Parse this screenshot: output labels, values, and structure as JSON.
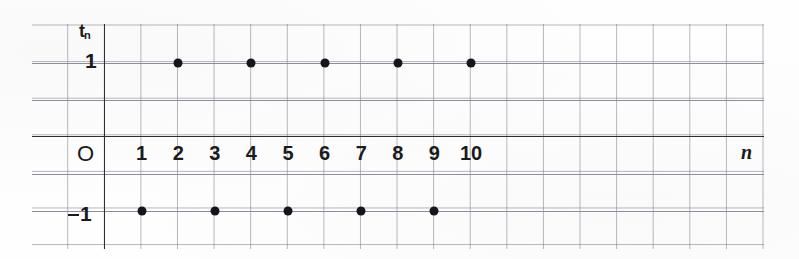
{
  "chart_data": {
    "type": "scatter",
    "title": "",
    "xlabel": "n",
    "ylabel": "t_n",
    "x": [
      1,
      2,
      3,
      4,
      5,
      6,
      7,
      8,
      9,
      10
    ],
    "values": [
      -1,
      1,
      -1,
      1,
      -1,
      1,
      -1,
      1,
      -1,
      1
    ],
    "series": [
      {
        "name": "t_n",
        "points": [
          {
            "n": 1,
            "t": -1
          },
          {
            "n": 2,
            "t": 1
          },
          {
            "n": 3,
            "t": -1
          },
          {
            "n": 4,
            "t": 1
          },
          {
            "n": 5,
            "t": -1
          },
          {
            "n": 6,
            "t": 1
          },
          {
            "n": 7,
            "t": -1
          },
          {
            "n": 8,
            "t": 1
          },
          {
            "n": 9,
            "t": -1
          },
          {
            "n": 10,
            "t": 1
          }
        ]
      }
    ],
    "xlim": [
      0,
      18
    ],
    "ylim": [
      -1.5,
      2
    ],
    "xticks": [
      "1",
      "2",
      "3",
      "4",
      "5",
      "6",
      "7",
      "8",
      "9",
      "10"
    ],
    "yticks": [
      "1",
      "-1"
    ],
    "grid": true,
    "legend": "none",
    "marker": "filled-circle",
    "marker_color": "#15151a"
  },
  "axes": {
    "y_axis_label": "t",
    "y_axis_label_sub": "n",
    "x_axis_label": "n",
    "origin_label": "O",
    "y_tick_positive": "1",
    "y_tick_negative_sign": "−",
    "y_tick_negative": "1"
  },
  "x_tick_labels": [
    "1",
    "2",
    "3",
    "4",
    "5",
    "6",
    "7",
    "8",
    "9",
    "10"
  ],
  "colors": {
    "grid_line": "#787d87",
    "axis_line": "#2e2e2e",
    "point": "#15151a",
    "text": "#1b1b1b",
    "background": "#fefefe"
  }
}
